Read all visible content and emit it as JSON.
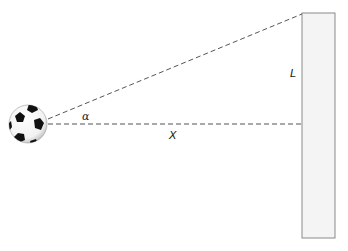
{
  "diagram": {
    "labels": {
      "angle": "α",
      "distance": "X",
      "height": "L"
    },
    "objects": {
      "ball": "soccer-ball",
      "wall": "wall"
    },
    "colors": {
      "line": "#555555",
      "wall_fill": "#f4f4f4",
      "wall_stroke": "#8a8a8a",
      "ball_fill": "#ffffff",
      "ball_patch": "#111111"
    }
  }
}
